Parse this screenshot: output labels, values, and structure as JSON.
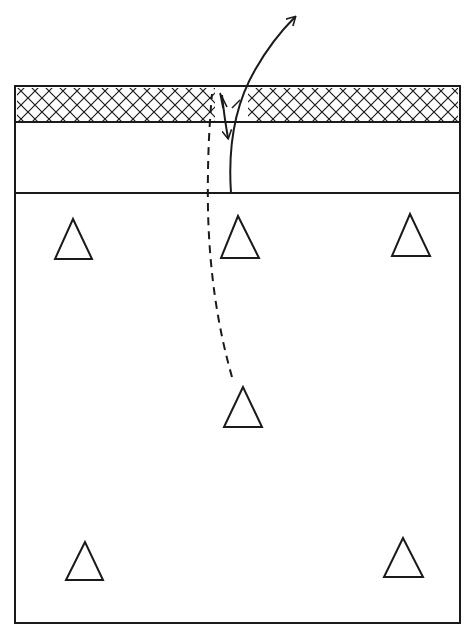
{
  "diagram": {
    "type": "volleyball-court-rotation",
    "stroke_color": "#1a1a1a",
    "background": "#ffffff",
    "court": {
      "x": 15,
      "y": 86,
      "w": 445,
      "h": 537
    },
    "net": {
      "y_top": 86,
      "y_bottom": 122,
      "pattern": "crosshatch"
    },
    "attack_line_y": 193,
    "players": [
      {
        "id": "left-front",
        "cx": 73,
        "top": 219,
        "base": 259
      },
      {
        "id": "center-front",
        "cx": 238,
        "top": 216,
        "base": 258
      },
      {
        "id": "right-front",
        "cx": 410,
        "top": 214,
        "base": 256
      },
      {
        "id": "center-back",
        "cx": 243,
        "top": 387,
        "base": 427
      },
      {
        "id": "left-back",
        "cx": 85,
        "top": 542,
        "base": 580
      },
      {
        "id": "right-back",
        "cx": 403,
        "top": 538,
        "base": 577
      }
    ],
    "movements": [
      {
        "id": "setter-run-dashed",
        "style": "dashed"
      },
      {
        "id": "set-ball-double-arrow",
        "style": "solid"
      },
      {
        "id": "attack-ball-arrow",
        "style": "solid"
      }
    ]
  }
}
